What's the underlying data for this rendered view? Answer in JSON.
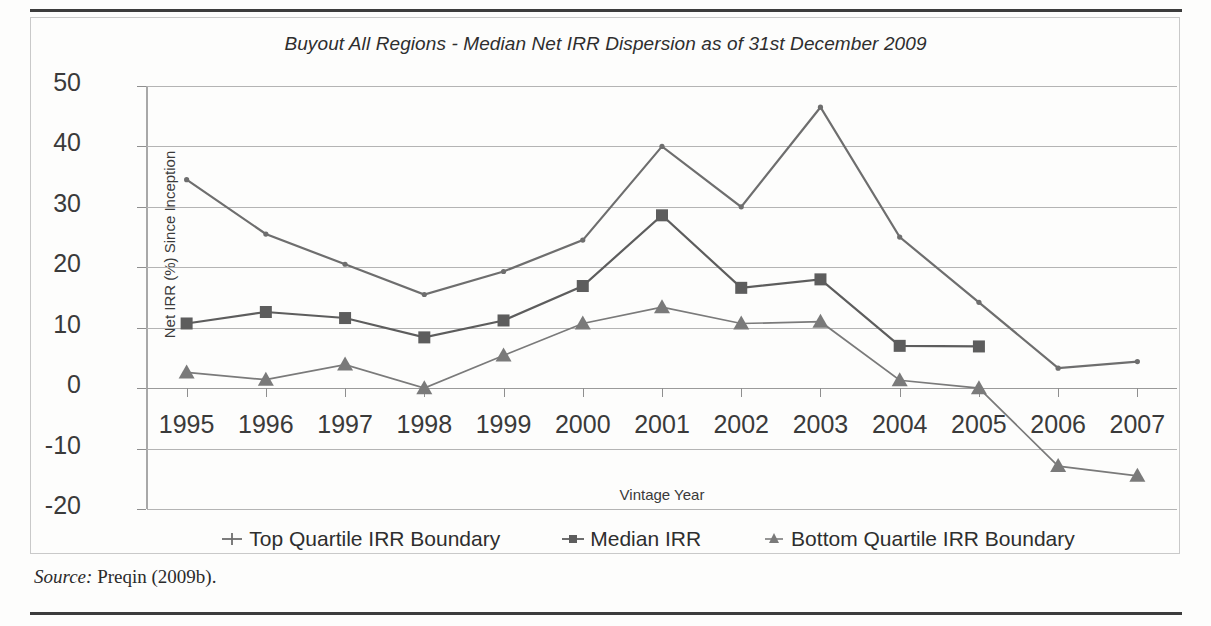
{
  "figure": {
    "title": "Buyout All Regions - Median Net IRR Dispersion as of 31st December 2009",
    "source_label": "Source:",
    "source_text": "Preqin (2009b)."
  },
  "legend": {
    "position": "bottom",
    "items": [
      {
        "label": "Top Quartile IRR Boundary",
        "marker": "plus-marker",
        "color": "#6e6e6e"
      },
      {
        "label": "Median IRR",
        "marker": "square-marker",
        "color": "#5d5d5d"
      },
      {
        "label": "Bottom Quartile IRR Boundary",
        "marker": "triangle-marker",
        "color": "#7a7a7a"
      }
    ]
  },
  "chart_data": {
    "type": "line",
    "title": "Buyout All Regions - Median Net IRR Dispersion as of 31st December 2009",
    "xlabel": "Vintage Year",
    "ylabel": "Net IRR (%) Since Inception",
    "categories": [
      "1995",
      "1996",
      "1997",
      "1998",
      "1999",
      "2000",
      "2001",
      "2002",
      "2003",
      "2004",
      "2005",
      "2006",
      "2007"
    ],
    "ylim": [
      -20,
      50
    ],
    "yticks": [
      -20,
      -10,
      0,
      10,
      20,
      30,
      40,
      50
    ],
    "grid": true,
    "legend_position": "bottom",
    "series": [
      {
        "name": "Top Quartile IRR Boundary",
        "marker": "plus",
        "color": "#6e6e6e",
        "values": [
          34.5,
          25.5,
          20.5,
          15.5,
          19.3,
          24.5,
          40.0,
          30.0,
          46.5,
          25.0,
          14.2,
          3.3,
          4.4
        ]
      },
      {
        "name": "Median IRR",
        "marker": "square",
        "color": "#5d5d5d",
        "values": [
          10.7,
          12.6,
          11.6,
          8.4,
          11.2,
          16.9,
          28.6,
          16.6,
          18.0,
          7.0,
          6.9,
          null,
          null
        ]
      },
      {
        "name": "Bottom Quartile IRR Boundary",
        "marker": "triangle",
        "color": "#7a7a7a",
        "values": [
          2.6,
          1.4,
          3.9,
          0.0,
          5.4,
          10.7,
          13.4,
          10.7,
          11.0,
          1.3,
          0.0,
          -12.9,
          -14.5
        ]
      }
    ]
  }
}
